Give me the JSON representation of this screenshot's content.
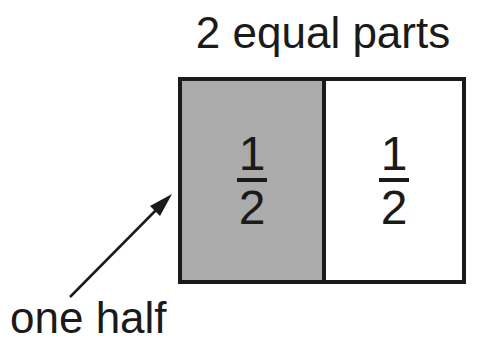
{
  "title": "2 equal parts",
  "parts": [
    {
      "numerator": "1",
      "denominator": "2",
      "shaded": true,
      "fill": "#ababab"
    },
    {
      "numerator": "1",
      "denominator": "2",
      "shaded": false,
      "fill": "#ffffff"
    }
  ],
  "label": "one half",
  "colors": {
    "stroke": "#1a1a1a",
    "shade": "#ababab",
    "background": "#ffffff"
  }
}
